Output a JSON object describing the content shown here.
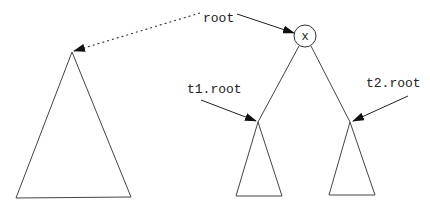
{
  "diagram": {
    "type": "binary-tree-merge",
    "stroke_color": "#3a3a3a",
    "arrow_color": "#111111",
    "labels": {
      "root": "root",
      "node": "x",
      "t1_root": "t1.root",
      "t2_root": "t2.root"
    },
    "nodes": [
      {
        "id": "x",
        "label": "x",
        "shape": "circle"
      }
    ],
    "subtrees": [
      {
        "id": "big-tree",
        "shape": "triangle",
        "description": "large subtree pointed to by dotted arrow from root"
      },
      {
        "id": "t1",
        "shape": "triangle",
        "description": "left child subtree of x"
      },
      {
        "id": "t2",
        "shape": "triangle",
        "description": "right child subtree of x"
      }
    ],
    "edges": [
      {
        "from": "root",
        "to": "x",
        "style": "solid-arrow"
      },
      {
        "from": "root",
        "to": "big-tree",
        "style": "dotted-arrow"
      },
      {
        "from": "x",
        "to": "t1",
        "style": "line"
      },
      {
        "from": "x",
        "to": "t2",
        "style": "line"
      },
      {
        "from": "t1.root",
        "to": "t1",
        "style": "solid-arrow"
      },
      {
        "from": "t2.root",
        "to": "t2",
        "style": "solid-arrow"
      }
    ]
  }
}
